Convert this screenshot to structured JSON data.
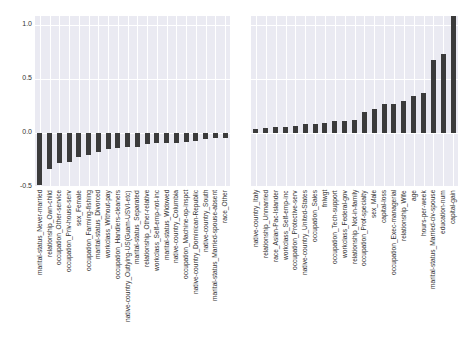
{
  "chart_data": [
    {
      "type": "bar",
      "title": "",
      "xlabel": "",
      "ylabel": "",
      "ylim": [
        -0.5,
        1.08
      ],
      "yticks": [
        "1.0",
        "0.5",
        "0.0",
        "-0.5"
      ],
      "grid": true,
      "categories": [
        "marital-status_Never-married",
        "relationship_Own-child",
        "occupation_Other-service",
        "occupation_Priv-house-serv",
        "sex_Female",
        "occupation_Farming-fishing",
        "marital-status_Divorced",
        "workclass_Without-pay",
        "occupation_Handlers-cleaners",
        "native-country_Outlying-US(Guam-USVI-etc)",
        "marital-status_Separated",
        "relationship_Other-relative",
        "workclass_Self-emp-not-inc",
        "marital-status_Widowed",
        "native-country_Columbia",
        "occupation_Machine-op-inspct",
        "native-country_Dominican-Republic",
        "native-country_South",
        "marital-status_Married-spouse-absent",
        "race_Other"
      ],
      "values": [
        -0.48,
        -0.33,
        -0.28,
        -0.27,
        -0.22,
        -0.2,
        -0.18,
        -0.15,
        -0.14,
        -0.13,
        -0.13,
        -0.1,
        -0.09,
        -0.09,
        -0.09,
        -0.08,
        -0.07,
        -0.06,
        -0.05,
        -0.05
      ]
    },
    {
      "type": "bar",
      "title": "",
      "xlabel": "",
      "ylabel": "",
      "ylim": [
        -0.5,
        1.08
      ],
      "yticks": [],
      "grid": true,
      "categories": [
        "native-country_Italy",
        "relationship_Unmarried",
        "race_Asian-Pac-Islander",
        "workclass_Self-emp-inc",
        "occupation_Protective-serv",
        "native-country_United-States",
        "occupation_Sales",
        "fnlwgt",
        "occupation_Tech-support",
        "workclass_Federal-gov",
        "relationship_Not-in-family",
        "occupation_Prof-specialty",
        "sex_Male",
        "capital-loss",
        "occupation_Exec-managerial",
        "relationship_Wife",
        "age",
        "hours-per-week",
        "marital-status_Married-civ-spouse",
        "education-num",
        "capital-gain"
      ],
      "values": [
        0.04,
        0.05,
        0.06,
        0.06,
        0.065,
        0.08,
        0.08,
        0.09,
        0.11,
        0.11,
        0.12,
        0.19,
        0.22,
        0.27,
        0.27,
        0.3,
        0.34,
        0.37,
        0.67,
        0.73,
        1.08
      ]
    }
  ],
  "colors": {
    "panel_bg": "#eaeaf2",
    "bar": "#3b3b3b",
    "grid": "#ffffff"
  }
}
